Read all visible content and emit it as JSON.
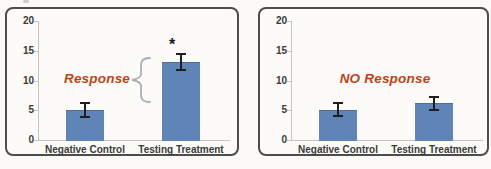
{
  "figure": {
    "background": "#fbfaf6",
    "panel_border_color": "#4d4d4d"
  },
  "chart_data": [
    {
      "type": "bar",
      "title": "",
      "categories": [
        "Negative Control",
        "Testing Treatment"
      ],
      "values": [
        5.1,
        13.1
      ],
      "error_bars": [
        1.2,
        1.3
      ],
      "yticks": [
        0,
        5,
        10,
        15,
        20
      ],
      "ylim": [
        0,
        20
      ],
      "grid": false,
      "legend": null,
      "bar_color": "#5e84b8",
      "axis_color": "#c6c6c0",
      "annotation": {
        "text": "Response",
        "color": "#bf421d"
      },
      "significance_marker": "*",
      "brace": true
    },
    {
      "type": "bar",
      "title": "",
      "categories": [
        "Negative Control",
        "Testing Treatment"
      ],
      "values": [
        5.1,
        6.2
      ],
      "error_bars": [
        1.1,
        1.1
      ],
      "yticks": [
        0,
        5,
        10,
        15,
        20
      ],
      "ylim": [
        0,
        20
      ],
      "grid": false,
      "legend": null,
      "bar_color": "#5e84b8",
      "axis_color": "#c6c6c0",
      "annotation": {
        "text": "NO Response",
        "color": "#bf421d"
      },
      "significance_marker": null,
      "brace": false
    }
  ]
}
